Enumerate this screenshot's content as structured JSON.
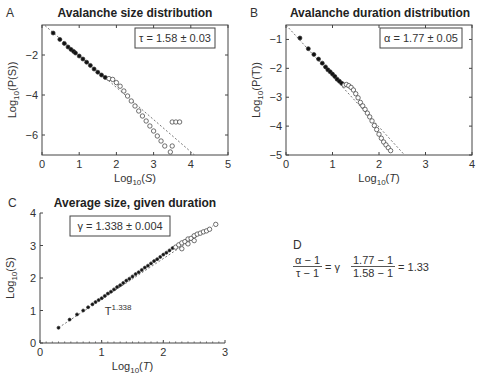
{
  "panels": {
    "A": {
      "letter": "A",
      "title": "Avalanche size distribution",
      "annotation": "τ = 1.58 ± 0.03",
      "xlabel_main": "Log",
      "xlabel_sub": "10",
      "xlabel_arg": "(S)",
      "ylabel": "Log10(P(S))"
    },
    "B": {
      "letter": "B",
      "title": "Avalanche duration distribution",
      "annotation": "α = 1.77 ± 0.05",
      "xlabel_main": "Log",
      "xlabel_sub": "10",
      "xlabel_arg": "(T)",
      "ylabel": "Log10(P(T))"
    },
    "C": {
      "letter": "C",
      "title": "Average size, given duration",
      "annotation": "γ = 1.338 ± 0.004",
      "fit_label": "T",
      "fit_exp": "1.338",
      "xlabel_main": "Log",
      "xlabel_sub": "10",
      "xlabel_arg": "(T)",
      "ylabel": "Log10(S)"
    },
    "D": {
      "letter": "D",
      "lhs_num": "α − 1",
      "lhs_den": "τ − 1",
      "eq1": "= γ",
      "rhs_num": "1.77 − 1",
      "rhs_den": "1.58 − 1",
      "eq2": "= 1.33"
    }
  },
  "chart_data": [
    {
      "type": "scatter",
      "title": "Avalanche size distribution",
      "xlabel": "Log10(S)",
      "ylabel": "Log10(P(S))",
      "xlim": [
        0,
        5
      ],
      "ylim": [
        -7,
        -0.5
      ],
      "xticks": [
        0,
        1,
        2,
        3,
        4,
        5
      ],
      "yticks": [
        -2,
        -4,
        -6
      ],
      "annotation": "τ = 1.58 ± 0.03",
      "fit_line": {
        "slope": -1.58,
        "style": "dashed",
        "points": [
          [
            0,
            -0.4
          ],
          [
            4.1,
            -7.0
          ]
        ]
      },
      "series": [
        {
          "name": "filled",
          "marker": "filled-circle",
          "points": [
            [
              0.3,
              -0.9
            ],
            [
              0.48,
              -1.22
            ],
            [
              0.6,
              -1.42
            ],
            [
              0.7,
              -1.6
            ],
            [
              0.78,
              -1.72
            ],
            [
              0.85,
              -1.82
            ],
            [
              0.9,
              -1.9
            ],
            [
              1.0,
              -2.05
            ],
            [
              1.1,
              -2.2
            ],
            [
              1.2,
              -2.36
            ],
            [
              1.3,
              -2.52
            ],
            [
              1.4,
              -2.7
            ],
            [
              1.5,
              -2.86
            ],
            [
              1.6,
              -3.0
            ],
            [
              1.7,
              -3.12
            ]
          ]
        },
        {
          "name": "open",
          "marker": "open-circle",
          "points": [
            [
              1.8,
              -3.18
            ],
            [
              1.9,
              -3.22
            ],
            [
              2.0,
              -3.38
            ],
            [
              2.1,
              -3.56
            ],
            [
              2.2,
              -3.8
            ],
            [
              2.3,
              -4.05
            ],
            [
              2.4,
              -4.3
            ],
            [
              2.5,
              -4.55
            ],
            [
              2.6,
              -4.8
            ],
            [
              2.7,
              -5.05
            ],
            [
              2.8,
              -5.3
            ],
            [
              2.9,
              -5.55
            ],
            [
              3.0,
              -5.8
            ],
            [
              3.1,
              -6.05
            ],
            [
              3.2,
              -6.3
            ],
            [
              3.3,
              -6.55
            ],
            [
              3.5,
              -6.55
            ],
            [
              3.45,
              -6.85
            ],
            [
              3.5,
              -5.35
            ],
            [
              3.6,
              -5.35
            ],
            [
              3.7,
              -5.35
            ]
          ]
        }
      ]
    },
    {
      "type": "scatter",
      "title": "Avalanche duration distribution",
      "xlabel": "Log10(T)",
      "ylabel": "Log10(P(T))",
      "xlim": [
        0,
        4
      ],
      "ylim": [
        -5,
        -0.5
      ],
      "xticks": [
        0,
        1,
        2,
        3,
        4
      ],
      "yticks": [
        -1,
        -2,
        -3,
        -4,
        -5
      ],
      "annotation": "α = 1.77 ± 0.05",
      "fit_line": {
        "slope": -1.77,
        "style": "dashed",
        "points": [
          [
            0,
            -0.5
          ],
          [
            2.55,
            -5.0
          ]
        ]
      },
      "series": [
        {
          "name": "filled",
          "marker": "filled-circle",
          "points": [
            [
              0.3,
              -0.95
            ],
            [
              0.48,
              -1.32
            ],
            [
              0.6,
              -1.52
            ],
            [
              0.7,
              -1.68
            ],
            [
              0.78,
              -1.82
            ],
            [
              0.85,
              -1.95
            ],
            [
              0.9,
              -2.05
            ],
            [
              0.95,
              -2.12
            ],
            [
              1.0,
              -2.2
            ],
            [
              1.05,
              -2.28
            ],
            [
              1.1,
              -2.38
            ],
            [
              1.15,
              -2.45
            ],
            [
              1.2,
              -2.52
            ]
          ]
        },
        {
          "name": "open",
          "marker": "open-circle",
          "points": [
            [
              1.25,
              -2.58
            ],
            [
              1.3,
              -2.56
            ],
            [
              1.35,
              -2.6
            ],
            [
              1.4,
              -2.66
            ],
            [
              1.45,
              -2.75
            ],
            [
              1.5,
              -2.88
            ],
            [
              1.55,
              -3.02
            ],
            [
              1.6,
              -3.18
            ],
            [
              1.65,
              -3.3
            ],
            [
              1.7,
              -3.42
            ],
            [
              1.75,
              -3.55
            ],
            [
              1.8,
              -3.68
            ],
            [
              1.85,
              -3.82
            ],
            [
              1.9,
              -3.98
            ],
            [
              1.95,
              -4.12
            ],
            [
              2.0,
              -4.28
            ],
            [
              2.05,
              -4.42
            ],
            [
              2.1,
              -4.55
            ],
            [
              2.15,
              -4.65
            ],
            [
              2.2,
              -4.75
            ],
            [
              2.25,
              -4.85
            ]
          ]
        }
      ]
    },
    {
      "type": "scatter",
      "title": "Average size, given duration",
      "xlabel": "Log10(T)",
      "ylabel": "Log10(S)",
      "xlim": [
        0,
        3
      ],
      "ylim": [
        0,
        4
      ],
      "xticks": [
        0,
        1,
        2,
        3
      ],
      "yticks": [
        0,
        1,
        2,
        3,
        4
      ],
      "annotation": "γ = 1.338 ± 0.004",
      "fit_label": "T^1.338",
      "fit_line": {
        "slope": 1.338,
        "style": "dashed",
        "points": [
          [
            0.3,
            0.47
          ],
          [
            2.8,
            3.6
          ]
        ]
      },
      "series": [
        {
          "name": "filled",
          "marker": "filled-circle",
          "points": [
            [
              0.3,
              0.47
            ],
            [
              0.48,
              0.72
            ],
            [
              0.6,
              0.88
            ],
            [
              0.7,
              1.0
            ],
            [
              0.78,
              1.1
            ],
            [
              0.85,
              1.19
            ],
            [
              0.9,
              1.26
            ],
            [
              0.95,
              1.32
            ],
            [
              1.0,
              1.38
            ],
            [
              1.05,
              1.45
            ],
            [
              1.1,
              1.52
            ],
            [
              1.15,
              1.58
            ],
            [
              1.2,
              1.65
            ],
            [
              1.25,
              1.72
            ],
            [
              1.3,
              1.78
            ],
            [
              1.35,
              1.85
            ],
            [
              1.4,
              1.92
            ],
            [
              1.45,
              1.98
            ],
            [
              1.5,
              2.05
            ],
            [
              1.55,
              2.12
            ],
            [
              1.6,
              2.18
            ],
            [
              1.65,
              2.25
            ],
            [
              1.7,
              2.32
            ],
            [
              1.75,
              2.38
            ],
            [
              1.8,
              2.45
            ],
            [
              1.85,
              2.52
            ],
            [
              1.9,
              2.58
            ],
            [
              1.95,
              2.65
            ],
            [
              2.0,
              2.72
            ],
            [
              2.05,
              2.78
            ],
            [
              2.1,
              2.85
            ],
            [
              2.15,
              2.92
            ]
          ]
        },
        {
          "name": "open",
          "marker": "open-circle",
          "points": [
            [
              2.2,
              2.95
            ],
            [
              2.25,
              3.02
            ],
            [
              2.3,
              3.08
            ],
            [
              2.35,
              3.12
            ],
            [
              2.4,
              3.2
            ],
            [
              2.45,
              3.22
            ],
            [
              2.5,
              3.3
            ],
            [
              2.55,
              3.35
            ],
            [
              2.6,
              3.38
            ],
            [
              2.65,
              3.42
            ],
            [
              2.7,
              3.45
            ],
            [
              2.75,
              3.5
            ],
            [
              2.85,
              3.65
            ],
            [
              2.3,
              2.9
            ],
            [
              2.4,
              3.05
            ],
            [
              2.5,
              3.15
            ]
          ]
        }
      ]
    }
  ]
}
